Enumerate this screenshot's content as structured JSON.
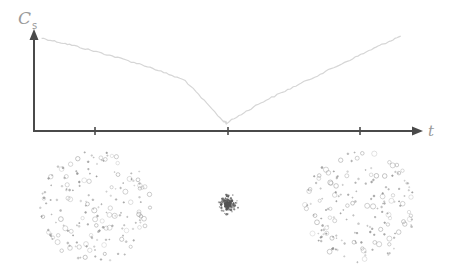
{
  "chart_data": {
    "type": "line",
    "title": "",
    "ylabel": "C",
    "ylabel_subscript": "s",
    "xlabel": "t",
    "x_ticks": [
      "t1",
      "t2",
      "t3"
    ],
    "x_tick_labels_shown": false,
    "y_ticks_shown": false,
    "grid": false,
    "legend": "none",
    "xlim": [
      0,
      1
    ],
    "ylim": [
      0,
      1
    ],
    "series": [
      {
        "name": "C_s",
        "x": [
          0.02,
          0.1,
          0.2,
          0.3,
          0.4,
          0.5,
          0.51,
          0.6,
          0.7,
          0.8,
          0.9,
          0.97
        ],
        "y": [
          0.92,
          0.85,
          0.75,
          0.64,
          0.5,
          0.1,
          0.08,
          0.28,
          0.46,
          0.64,
          0.82,
          0.94
        ]
      }
    ],
    "snapshots": [
      {
        "name": "dispersed-start",
        "at_tick": 0,
        "spread": "wide",
        "particles": 180
      },
      {
        "name": "condensed-middle",
        "at_tick": 1,
        "spread": "tight",
        "particles": 220
      },
      {
        "name": "dispersed-end",
        "at_tick": 2,
        "spread": "wide",
        "particles": 180
      }
    ]
  },
  "colors": {
    "axis": "#4a4a4a",
    "curve": "#d6d6d6",
    "label": "#9a9a9a",
    "particle": "#8a8a8a"
  }
}
